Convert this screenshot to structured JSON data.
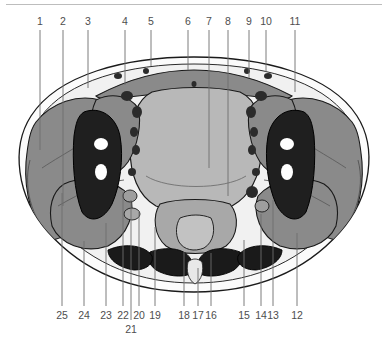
{
  "figure": {
    "type": "anatomical-cross-section-diagram",
    "orientation": "axial",
    "background_color": "#ffffff",
    "label_color": "#4e4e4e",
    "leader_line_color": "#6e6e6e",
    "outline_color": "#1a1a1a"
  },
  "palette": {
    "skin_outline": "#ffffff",
    "subcutaneous_fat": "#f2f2f2",
    "muscle_gray": "#8a8a8a",
    "organ_light_gray": "#b8b8b8",
    "bone_dark": "#1f1f1f",
    "marrow_white": "#ffffff",
    "vessel_dark": "#2b2b2b",
    "cartilage_mid": "#9e9e9e"
  },
  "labels": {
    "top_row": [
      {
        "id": "1",
        "x": 40,
        "leader_x": 40,
        "leader_y2": 150
      },
      {
        "id": "2",
        "x": 63,
        "leader_x": 63,
        "leader_y2": 206
      },
      {
        "id": "3",
        "x": 88,
        "leader_x": 88,
        "leader_y2": 88
      },
      {
        "id": "4",
        "x": 125,
        "leader_x": 125,
        "leader_y2": 85
      },
      {
        "id": "5",
        "x": 151,
        "leader_x": 151,
        "leader_y2": 66
      },
      {
        "id": "6",
        "x": 188,
        "leader_x": 188,
        "leader_y2": 70
      },
      {
        "id": "7",
        "x": 209,
        "leader_x": 209,
        "leader_y2": 168
      },
      {
        "id": "8",
        "x": 228,
        "leader_x": 228,
        "leader_y2": 196
      },
      {
        "id": "9",
        "x": 249,
        "leader_x": 249,
        "leader_y2": 78
      },
      {
        "id": "10",
        "x": 266,
        "leader_x": 266,
        "leader_y2": 72
      },
      {
        "id": "11",
        "x": 295,
        "leader_x": 295,
        "leader_y2": 92
      }
    ],
    "bottom_row": [
      {
        "id": "25",
        "x": 62,
        "leader_x": 62,
        "leader_y1": 193
      },
      {
        "id": "24",
        "x": 84,
        "leader_x": 84,
        "leader_y1": 241
      },
      {
        "id": "23",
        "x": 106,
        "leader_x": 106,
        "leader_y1": 223
      },
      {
        "id": "22",
        "x": 123,
        "leader_x": 123,
        "leader_y1": 192
      },
      {
        "id": "20",
        "x": 139,
        "leader_x": 139,
        "leader_y1": 212
      },
      {
        "id": "19",
        "x": 155,
        "leader_x": 155,
        "leader_y1": 227
      },
      {
        "id": "18",
        "x": 184,
        "leader_x": 184,
        "leader_y1": 252
      },
      {
        "id": "17",
        "x": 198,
        "leader_x": 198,
        "leader_y1": 268
      },
      {
        "id": "16",
        "x": 211,
        "leader_x": 211,
        "leader_y1": 253
      },
      {
        "id": "15",
        "x": 244,
        "leader_x": 244,
        "leader_y1": 240
      },
      {
        "id": "14",
        "x": 261,
        "leader_x": 261,
        "leader_y1": 214
      },
      {
        "id": "13",
        "x": 273,
        "leader_x": 273,
        "leader_y1": 200
      },
      {
        "id": "12",
        "x": 297,
        "leader_x": 297,
        "leader_y1": 233
      }
    ],
    "sub_row": [
      {
        "id": "21",
        "x": 131,
        "leader_x": 131,
        "leader_y1": 200
      }
    ]
  }
}
